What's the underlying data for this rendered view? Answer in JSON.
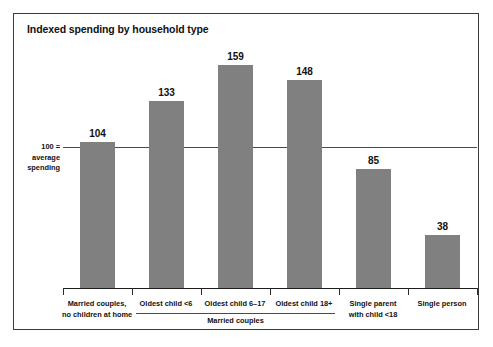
{
  "chart_data": {
    "type": "bar",
    "title": "Indexed spending by household type",
    "xlabel": "",
    "ylabel": "",
    "ylim": [
      0,
      175
    ],
    "grid": false,
    "legend": "none",
    "categories": [
      "Married couples,\nno children at home",
      "Oldest child <6",
      "Oldest child 6–17",
      "Oldest child 18+",
      "Single parent\nwith child <18",
      "Single person"
    ],
    "values": [
      104,
      133,
      159,
      148,
      85,
      38
    ],
    "annotations": {
      "reference_line_value": 100,
      "reference_line_label": "100 =\naverage\nspending",
      "group_bracket_label": "Married couples",
      "group_bracket_categories": [
        "Oldest child <6",
        "Oldest child 6–17",
        "Oldest child 18+"
      ]
    },
    "colors": {
      "bar": "#808080",
      "axis": "#1d1d1d",
      "reference_line": "#4a4a4a",
      "text": "#111111",
      "frame": "#3a3a3a",
      "background": "#ffffff"
    }
  },
  "categories_display": [
    {
      "line1": "Married couples,",
      "line2": "no children at home"
    },
    {
      "line1": "Oldest child <6",
      "line2": ""
    },
    {
      "line1": "Oldest child 6–17",
      "line2": ""
    },
    {
      "line1": "Oldest child 18+",
      "line2": ""
    },
    {
      "line1": "Single parent",
      "line2": "with child <18"
    },
    {
      "line1": "Single person",
      "line2": ""
    }
  ],
  "reference_display": {
    "line1": "100 =",
    "line2": "average",
    "line3": "spending"
  },
  "values_display": [
    "104",
    "133",
    "159",
    "148",
    "85",
    "38"
  ],
  "group_bracket": {
    "label": "Married couples"
  }
}
